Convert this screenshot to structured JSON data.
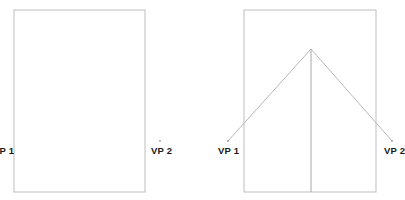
{
  "figure": {
    "type": "two-point-perspective-construction",
    "background_color": "#ffffff",
    "line_color": "#b9b9b9",
    "box_line_color": "#bdbdbd",
    "label_color": "#1a1a1a",
    "dot_color": "#9a9a9a",
    "width": 405,
    "height": 200
  },
  "diagrams": [
    {
      "id": "left",
      "name": "plain-rectangle-with-vanishing-points",
      "rect": {
        "x": 14,
        "y": 10,
        "width": 131,
        "height": 182
      },
      "vanishing_points": [
        {
          "id": "vp1",
          "label": "VP 1",
          "x": -2,
          "y": 141,
          "clipped": true
        },
        {
          "id": "vp2",
          "label": "VP 2",
          "x": 160,
          "y": 141,
          "clipped": false
        }
      ],
      "convergence_lines": [],
      "center_line": null
    },
    {
      "id": "right",
      "name": "rectangle-with-convergence-lines",
      "rect": {
        "x": 244,
        "y": 10,
        "width": 132,
        "height": 182
      },
      "apex": {
        "x": 311,
        "y": 49
      },
      "vanishing_points": [
        {
          "id": "vp1",
          "label": "VP 1",
          "x": 228,
          "y": 141,
          "clipped": false
        },
        {
          "id": "vp2",
          "label": "VP 2",
          "x": 392,
          "y": 141,
          "clipped": true
        }
      ],
      "convergence_lines": [
        {
          "from": "apex",
          "to": "vp1",
          "x1": 311,
          "y1": 49,
          "x2": 228,
          "y2": 141
        },
        {
          "from": "apex",
          "to": "vp2",
          "x1": 311,
          "y1": 49,
          "x2": 392,
          "y2": 141
        }
      ],
      "center_line": {
        "x1": 311,
        "y1": 49,
        "x2": 311,
        "y2": 192
      }
    }
  ],
  "labels": {
    "left_vp1": "VP 1",
    "left_vp2": "VP 2",
    "right_vp1": "VP 1",
    "right_vp2": "VP 2"
  }
}
